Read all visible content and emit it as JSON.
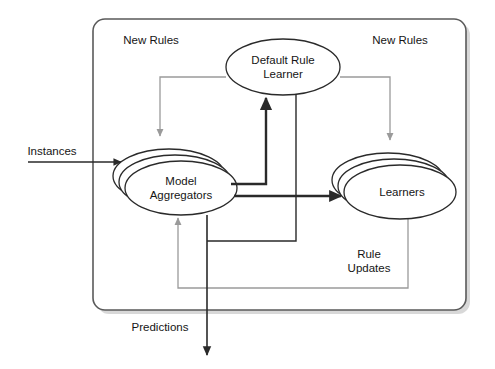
{
  "diagram": {
    "container": {
      "name": "system-boundary",
      "shape": "rounded-rectangle",
      "has_shadow": true,
      "stroke_color": "#5a5a5a",
      "fill_color": "#ffffff"
    },
    "nodes": [
      {
        "id": "default-rule-learner",
        "label_line1": "Default Rule",
        "label_line2": "Learner",
        "shape": "ellipse",
        "stacked": false,
        "cx": 283,
        "cy": 67,
        "rx": 57,
        "ry": 28,
        "stroke_color": "#2a2a2a"
      },
      {
        "id": "model-aggregators",
        "label_line1": "Model",
        "label_line2": "Aggregators",
        "shape": "ellipse",
        "stacked": true,
        "stack_count": 3,
        "cx": 181,
        "cy": 188,
        "rx": 56,
        "ry": 27,
        "stroke_color": "#2a2a2a"
      },
      {
        "id": "learners",
        "label_line1": "Learners",
        "label_line2": "",
        "shape": "ellipse",
        "stacked": true,
        "stack_count": 3,
        "cx": 400,
        "cy": 192,
        "rx": 56,
        "ry": 27,
        "stroke_color": "#2a2a2a"
      }
    ],
    "edge_labels": [
      {
        "id": "new-rules-left",
        "text": "New Rules",
        "x": 151,
        "y": 44,
        "anchor": "middle"
      },
      {
        "id": "new-rules-right",
        "text": "New Rules",
        "x": 400,
        "y": 44,
        "anchor": "middle"
      },
      {
        "id": "instances",
        "text": "Instances",
        "x": 52,
        "y": 155,
        "anchor": "middle"
      },
      {
        "id": "predictions",
        "text": "Predictions",
        "x": 160,
        "y": 331,
        "anchor": "middle"
      },
      {
        "id": "rule-updates-l1",
        "text": "Rule",
        "x": 369,
        "y": 258,
        "anchor": "middle"
      },
      {
        "id": "rule-updates-l2",
        "text": "Updates",
        "x": 369,
        "y": 272,
        "anchor": "middle"
      }
    ],
    "connectors": [
      {
        "id": "instances-input",
        "from": "external",
        "to": "model-aggregators",
        "style": "solid-dark",
        "weight": "thin"
      },
      {
        "id": "aggregators-to-learners",
        "from": "model-aggregators",
        "to": "learners",
        "style": "solid-dark",
        "weight": "thick"
      },
      {
        "id": "aggregators-to-drl",
        "from": "model-aggregators",
        "to": "default-rule-learner",
        "style": "solid-dark",
        "weight": "thick"
      },
      {
        "id": "drl-new-rules-left",
        "from": "default-rule-learner",
        "to": "model-aggregators",
        "style": "solid-gray",
        "weight": "thin"
      },
      {
        "id": "drl-new-rules-right",
        "from": "default-rule-learner",
        "to": "learners",
        "style": "solid-gray",
        "weight": "thin"
      },
      {
        "id": "drl-down-to-aggregators",
        "from": "default-rule-learner",
        "to": "model-aggregators",
        "style": "solid-dark",
        "weight": "thin"
      },
      {
        "id": "learners-rule-updates",
        "from": "learners",
        "to": "model-aggregators",
        "style": "solid-gray",
        "weight": "thin"
      },
      {
        "id": "predictions-output",
        "from": "model-aggregators",
        "to": "external",
        "style": "solid-dark",
        "weight": "thin"
      }
    ],
    "colors": {
      "dark_stroke": "#2a2a2a",
      "gray_stroke": "#9a9a9a",
      "box_stroke": "#5a5a5a",
      "text": "#151515",
      "shadow": "#b8b8b8",
      "background": "#ffffff"
    }
  }
}
